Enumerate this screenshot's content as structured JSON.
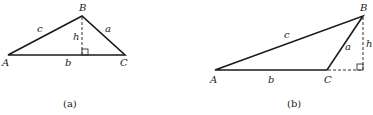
{
  "figures": [
    {
      "id": "a",
      "caption": "(a)",
      "type": "acute triangle with interior altitude",
      "vertices": {
        "A": "A",
        "B": "B",
        "C": "C"
      },
      "sides": {
        "a": "a",
        "b": "b",
        "c": "c"
      },
      "altitude": "h"
    },
    {
      "id": "b",
      "caption": "(b)",
      "type": "obtuse triangle with exterior altitude",
      "vertices": {
        "A": "A",
        "B": "B",
        "C": "C"
      },
      "sides": {
        "a": "a",
        "b": "b",
        "c": "c"
      },
      "altitude": "h"
    }
  ],
  "colors": {
    "stroke": "#1a1a1a",
    "background": "#ffffff"
  }
}
